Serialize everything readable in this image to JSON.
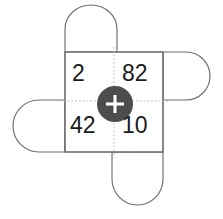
{
  "figure": {
    "type": "net-diagram",
    "colors": {
      "background": "#ffffff",
      "outline": "#6e6e6e",
      "guide": "#b9b9b9",
      "hub_fill": "#4d4d4d",
      "hub_glyph": "#ffffff",
      "number_text": "#1a1a1a"
    }
  },
  "center_square": {
    "name": "center-square",
    "quadrants": [
      {
        "position": "top-left",
        "value": "2"
      },
      {
        "position": "top-right",
        "value": "82"
      },
      {
        "position": "bottom-left",
        "value": "42"
      },
      {
        "position": "bottom-right",
        "value": "10"
      }
    ]
  },
  "hub": {
    "icon": "plus-icon",
    "glyph": "+",
    "label": ""
  },
  "flaps": [
    {
      "name": "flap-top",
      "position": "top"
    },
    {
      "name": "flap-right",
      "position": "right"
    },
    {
      "name": "flap-bottom",
      "position": "bottom"
    },
    {
      "name": "flap-left",
      "position": "left"
    }
  ],
  "guides": [
    {
      "name": "guide-horizontal",
      "orientation": "horizontal"
    },
    {
      "name": "guide-vertical",
      "orientation": "vertical"
    }
  ]
}
